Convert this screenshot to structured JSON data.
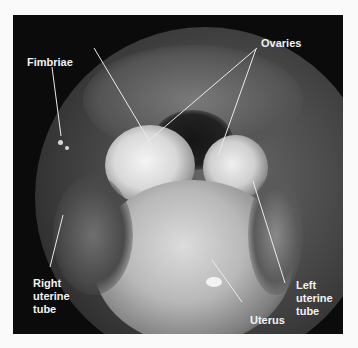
{
  "figure": {
    "labels": {
      "fimbriae": "Fimbriae",
      "ovaries": "Ovaries",
      "right_uterine_tube": [
        "Right",
        "uterine",
        "tube"
      ],
      "left_uterine_tube": [
        "Left",
        "uterine",
        "tube"
      ],
      "uterus": "Uterus"
    }
  }
}
